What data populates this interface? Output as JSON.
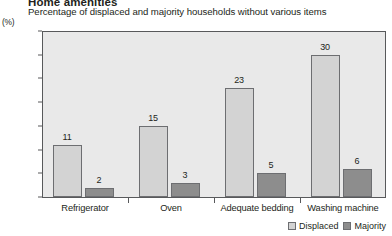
{
  "chart_data": {
    "type": "bar",
    "title": "Home amenities",
    "subtitle": "Percentage of displaced and majority households without various items",
    "ylabel": "(%)",
    "xlabel": "",
    "ylim": [
      0,
      35
    ],
    "yticks": [
      0,
      5,
      10,
      15,
      20,
      25,
      30,
      35
    ],
    "grid": false,
    "legend_position": "bottom-right",
    "categories": [
      "Refrigerator",
      "Oven",
      "Adequate bedding",
      "Washing machine"
    ],
    "series": [
      {
        "name": "Displaced",
        "color": "#d3d3d3",
        "values": [
          11,
          15,
          23,
          30
        ]
      },
      {
        "name": "Majority",
        "color": "#8d8d8d",
        "values": [
          2,
          3,
          5,
          6
        ]
      }
    ],
    "value_labels": {
      "Refrigerator": [
        "11",
        "2"
      ],
      "Oven": [
        "15",
        "3"
      ],
      "Adequate bedding": [
        "23",
        "5"
      ],
      "Washing machine": [
        "30",
        "6"
      ]
    },
    "plot_background": "#e9e9e9",
    "axis_color": "#58595b"
  }
}
